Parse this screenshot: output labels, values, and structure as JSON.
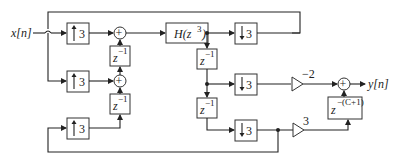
{
  "diagram": {
    "type": "polyphase multirate block diagram",
    "input_label": "x[n]",
    "output_label": "y[n]",
    "upsamplers": [
      {
        "id": "up1",
        "label": "3"
      },
      {
        "id": "up2",
        "label": "3"
      },
      {
        "id": "up3",
        "label": "3"
      }
    ],
    "adders": [
      {
        "id": "add1",
        "symbol": "+"
      },
      {
        "id": "add2",
        "symbol": "+"
      },
      {
        "id": "add_out",
        "symbol": "+"
      }
    ],
    "delays_left": [
      {
        "id": "dl1",
        "base": "z",
        "exp": "−1"
      },
      {
        "id": "dl2",
        "base": "z",
        "exp": "−1"
      }
    ],
    "filter": {
      "label_prefix": "H(z",
      "label_exp": "3",
      "label_suffix": ")"
    },
    "delays_right": [
      {
        "id": "dr1",
        "base": "z",
        "exp": "−1"
      },
      {
        "id": "dr2",
        "base": "z",
        "exp": "−1"
      }
    ],
    "downsamplers": [
      {
        "id": "down1",
        "label": "3"
      },
      {
        "id": "down2",
        "label": "3"
      },
      {
        "id": "down3",
        "label": "3"
      }
    ],
    "gains": [
      {
        "id": "gain1",
        "label": "−2"
      },
      {
        "id": "gain2",
        "label": "3"
      }
    ],
    "output_delay": {
      "base": "z",
      "exp": "−(C+1)"
    }
  }
}
